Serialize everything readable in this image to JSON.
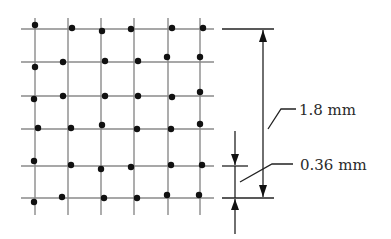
{
  "diagram": {
    "grid": {
      "columns_x": [
        35,
        68,
        101,
        134,
        168,
        200
      ],
      "rows_y": [
        29,
        62,
        96,
        129,
        166,
        198
      ],
      "x_extent": [
        21,
        214
      ],
      "y_extent": [
        18,
        215
      ],
      "line_color": "#8a8a8a"
    },
    "dots": [
      [
        35,
        25
      ],
      [
        72,
        28
      ],
      [
        102,
        31
      ],
      [
        131,
        29
      ],
      [
        172,
        28
      ],
      [
        203,
        28
      ],
      [
        35,
        67
      ],
      [
        63,
        62
      ],
      [
        105,
        61
      ],
      [
        138,
        61
      ],
      [
        167,
        57
      ],
      [
        200,
        57
      ],
      [
        34,
        99
      ],
      [
        63,
        96
      ],
      [
        105,
        96
      ],
      [
        138,
        96
      ],
      [
        172,
        97
      ],
      [
        200,
        92
      ],
      [
        38,
        128
      ],
      [
        71,
        128
      ],
      [
        102,
        125
      ],
      [
        137,
        129
      ],
      [
        171,
        129
      ],
      [
        200,
        124
      ],
      [
        34,
        161
      ],
      [
        71,
        165
      ],
      [
        101,
        169
      ],
      [
        131,
        167
      ],
      [
        171,
        165
      ],
      [
        202,
        165
      ],
      [
        34,
        202
      ],
      [
        62,
        197
      ],
      [
        104,
        198
      ],
      [
        137,
        198
      ],
      [
        167,
        195
      ],
      [
        199,
        195
      ]
    ],
    "dot_color": "#111111",
    "dimensions": {
      "overall": {
        "label": "1.8 mm",
        "value_mm": 1.8
      },
      "spacing": {
        "label": "0.36 mm",
        "value_mm": 0.36
      }
    }
  }
}
